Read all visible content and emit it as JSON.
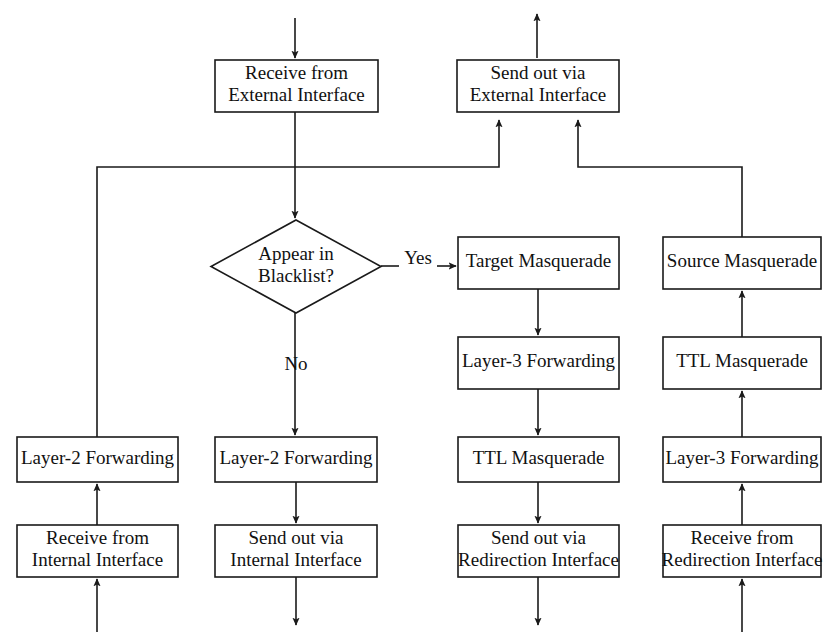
{
  "diagram": {
    "colors": {
      "background": "#ffffff",
      "stroke": "#1a1a1a",
      "text": "#111111",
      "node_fill": "#ffffff"
    },
    "canvas": {
      "width": 837,
      "height": 640
    },
    "nodes": [
      {
        "id": "receive-external",
        "shape": "rect",
        "lines": [
          "Receive from",
          "External Interface"
        ],
        "x": 215,
        "y": 60,
        "w": 163,
        "h": 52
      },
      {
        "id": "send-external",
        "shape": "rect",
        "lines": [
          "Send out via",
          "External Interface"
        ],
        "x": 457,
        "y": 60,
        "w": 162,
        "h": 52
      },
      {
        "id": "appear-in-blacklist",
        "shape": "diamond",
        "lines": [
          "Appear in",
          "Blacklist?"
        ],
        "x": 211,
        "y": 220,
        "w": 170,
        "h": 93
      },
      {
        "id": "target-masquerade",
        "shape": "rect",
        "lines": [
          "Target Masquerade"
        ],
        "x": 458,
        "y": 237,
        "w": 161,
        "h": 52
      },
      {
        "id": "source-masquerade",
        "shape": "rect",
        "lines": [
          "Source Masquerade"
        ],
        "x": 663,
        "y": 237,
        "w": 158,
        "h": 52
      },
      {
        "id": "layer3-forwarding-col3",
        "shape": "rect",
        "lines": [
          "Layer-3 Forwarding"
        ],
        "x": 458,
        "y": 337,
        "w": 161,
        "h": 52
      },
      {
        "id": "ttl-masquerade-col4",
        "shape": "rect",
        "lines": [
          "TTL Masquerade"
        ],
        "x": 663,
        "y": 337,
        "w": 158,
        "h": 52
      },
      {
        "id": "layer2-forwarding-col1",
        "shape": "rect",
        "lines": [
          "Layer-2 Forwarding"
        ],
        "x": 17,
        "y": 437,
        "w": 161,
        "h": 45
      },
      {
        "id": "layer2-forwarding-col2",
        "shape": "rect",
        "lines": [
          "Layer-2 Forwarding"
        ],
        "x": 215,
        "y": 437,
        "w": 162,
        "h": 45
      },
      {
        "id": "ttl-masquerade-col3",
        "shape": "rect",
        "lines": [
          "TTL Masquerade"
        ],
        "x": 458,
        "y": 437,
        "w": 161,
        "h": 45
      },
      {
        "id": "layer3-forwarding-col4",
        "shape": "rect",
        "lines": [
          "Layer-3 Forwarding"
        ],
        "x": 663,
        "y": 437,
        "w": 158,
        "h": 45
      },
      {
        "id": "receive-internal",
        "shape": "rect",
        "lines": [
          "Receive from",
          "Internal Interface"
        ],
        "x": 17,
        "y": 525,
        "w": 161,
        "h": 52
      },
      {
        "id": "send-internal",
        "shape": "rect",
        "lines": [
          "Send out via",
          "Internal Interface"
        ],
        "x": 215,
        "y": 525,
        "w": 162,
        "h": 52
      },
      {
        "id": "send-redirection",
        "shape": "rect",
        "lines": [
          "Send out via",
          "Redirection Interface"
        ],
        "x": 458,
        "y": 525,
        "w": 161,
        "h": 52
      },
      {
        "id": "receive-redirection",
        "shape": "rect",
        "lines": [
          "Receive from",
          "Redirection Interface"
        ],
        "x": 663,
        "y": 525,
        "w": 158,
        "h": 52
      }
    ],
    "edges": [
      {
        "id": "edge-in-external",
        "points": "295,18 295,58",
        "arrow": "end"
      },
      {
        "id": "edge-out-external",
        "points": "537,58 537,14",
        "arrow": "end"
      },
      {
        "id": "edge-receive-external-to-blacklist",
        "points": "295,112 295,218",
        "arrow": "end"
      },
      {
        "id": "edge-blacklist-yes-to-target",
        "points": "381,266 399,266",
        "arrow": "none"
      },
      {
        "id": "edge-yes-arrow-to-target",
        "points": "437,266 456,266",
        "arrow": "end"
      },
      {
        "id": "edge-blacklist-no-to-layer2",
        "points": "295,313 295,435",
        "arrow": "end"
      },
      {
        "id": "edge-target-to-layer3",
        "points": "538,289 538,335",
        "arrow": "end"
      },
      {
        "id": "edge-layer3-to-ttl-col3",
        "points": "538,389 538,435",
        "arrow": "end"
      },
      {
        "id": "edge-ttl-col3-to-send-redirection",
        "points": "538,482 538,523",
        "arrow": "end"
      },
      {
        "id": "edge-send-redirection-out",
        "points": "538,577 538,625",
        "arrow": "end"
      },
      {
        "id": "edge-layer2-col2-to-send-internal",
        "points": "296,482 296,523",
        "arrow": "end"
      },
      {
        "id": "edge-send-internal-out",
        "points": "296,577 296,625",
        "arrow": "end"
      },
      {
        "id": "edge-in-internal",
        "points": "97,632 97,579",
        "arrow": "end"
      },
      {
        "id": "edge-receive-internal-to-layer2-col1",
        "points": "97,525 97,484",
        "arrow": "end"
      },
      {
        "id": "edge-layer2-col1-to-external",
        "points": "97,437 97,167 499,167 499,120",
        "arrow": "end"
      },
      {
        "id": "edge-in-redirection",
        "points": "742,632 742,579",
        "arrow": "end"
      },
      {
        "id": "edge-receive-redirection-to-layer3-col4",
        "points": "742,525 742,484",
        "arrow": "end"
      },
      {
        "id": "edge-layer3-col4-to-ttl-col4",
        "points": "742,437 742,391",
        "arrow": "end"
      },
      {
        "id": "edge-ttl-col4-to-source",
        "points": "742,337 742,291",
        "arrow": "end"
      },
      {
        "id": "edge-source-to-external",
        "points": "742,237 742,167 578,167 578,120",
        "arrow": "end"
      }
    ],
    "edge_labels": [
      {
        "id": "label-yes",
        "text": "Yes",
        "x": 418,
        "y": 260
      },
      {
        "id": "label-no",
        "text": "No",
        "x": 296,
        "y": 366
      }
    ]
  }
}
